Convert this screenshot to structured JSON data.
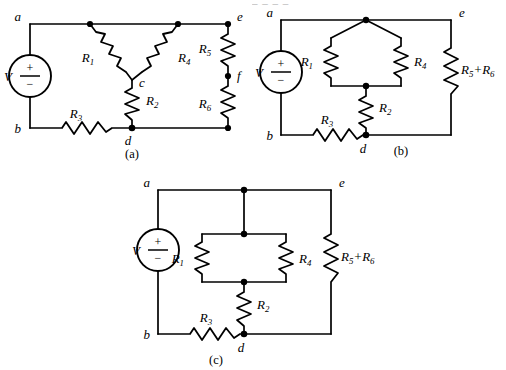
{
  "figure": {
    "title_fragment": "_ _ _ _",
    "nodes": {
      "a": "a",
      "b": "b",
      "c": "c",
      "d": "d",
      "e": "e",
      "f": "f"
    },
    "source_label": "V",
    "source_plus": "+",
    "source_minus": "−",
    "resistors": {
      "r1": "R",
      "r1sub": "1",
      "r2": "R",
      "r2sub": "2",
      "r3": "R",
      "r3sub": "3",
      "r4": "R",
      "r4sub": "4",
      "r5": "R",
      "r5sub": "5",
      "r6": "R",
      "r6sub": "6"
    },
    "series_label": {
      "left": "R",
      "leftsub": "5",
      "op": "+",
      "right": "R",
      "rightsub": "6"
    },
    "panels": [
      {
        "id": "a",
        "caption": "(a)",
        "description": "Original network: wye (Y) of R1, R4, R2 joined at node c between a, e and d; R3 in bottom branch; R5 and R6 in series between e and d through node f; source V between a and b.",
        "nodes": [
          "a",
          "b",
          "c",
          "d",
          "e",
          "f"
        ],
        "components": [
          "V",
          "R1",
          "R2",
          "R3",
          "R4",
          "R5",
          "R6"
        ]
      },
      {
        "id": "b",
        "caption": "(b)",
        "description": "R1 and R4 redrawn in parallel between node a and the top of R2; R2 in series to node d; R3 in bottom branch; R5 and R6 combined as a single series element between e and d.",
        "nodes": [
          "a",
          "b",
          "d",
          "e"
        ],
        "components": [
          "V",
          "R1",
          "R2",
          "R3",
          "R4",
          "R5+R6"
        ]
      },
      {
        "id": "c",
        "caption": "(c)",
        "description": "Parallel pair R1 and R4 drawn as a rectangular ladder hanging from node a, R2 in series to node d, R3 in bottom branch, R5+R6 on the right branch between e and d.",
        "nodes": [
          "a",
          "b",
          "d",
          "e"
        ],
        "components": [
          "V",
          "R1",
          "R2",
          "R3",
          "R4",
          "R5+R6"
        ]
      }
    ]
  }
}
